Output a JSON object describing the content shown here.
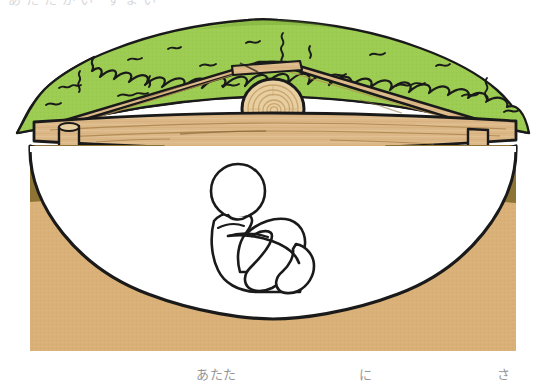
{
  "illustration": {
    "title": "Cross-section of a pit dwelling with a grass-covered roof",
    "subject": "pit-dwelling-cutaway",
    "description": "Side cutaway view of an ancient pit dwelling: a green grass/thatch covered mound roof rests on two sloping wooden beams that meet over a round-cut log ridge post, spanning an excavated earth pit in which a person sits hugging their knees.",
    "colors": {
      "foliage_light": "#9ccc52",
      "foliage_mid": "#8bc34a",
      "foliage_dark": "#6f9f31",
      "outline": "#1a1a1a",
      "wood_light": "#e3c28f",
      "wood_mid": "#d2ab74",
      "wood_dark": "#b98f52",
      "log_face": "#e8cfa2",
      "log_ring": "#c9a46d",
      "soil_dark": "#8e7434",
      "soil_light": "#d9b178",
      "pit_interior": "#ffffff",
      "background": "#ffffff",
      "caption_text": "#6e6e72"
    },
    "elements": [
      {
        "name": "grass-roof",
        "label": "grass / thatch covered roof mound"
      },
      {
        "name": "left-roof-beam",
        "label": "left sloping wooden roof beam"
      },
      {
        "name": "right-roof-beam",
        "label": "right sloping wooden roof beam"
      },
      {
        "name": "ridge-log",
        "label": "round cut log ridge post with visible growth rings"
      },
      {
        "name": "horizontal-beam",
        "label": "long horizontal wooden beam spanning the pit"
      },
      {
        "name": "left-support-post",
        "label": "left vertical support post"
      },
      {
        "name": "right-support-post",
        "label": "right vertical support post"
      },
      {
        "name": "earth-ground",
        "label": "cut-away earth / soil ground"
      },
      {
        "name": "dwelling-pit",
        "label": "excavated dwelling pit interior"
      },
      {
        "name": "seated-person",
        "label": "person sitting hugging their knees"
      }
    ]
  },
  "captions": {
    "top_clipped_text": "あたたかい すまい",
    "fragment_1": "あたた",
    "fragment_2": "に",
    "fragment_3": "さ"
  }
}
